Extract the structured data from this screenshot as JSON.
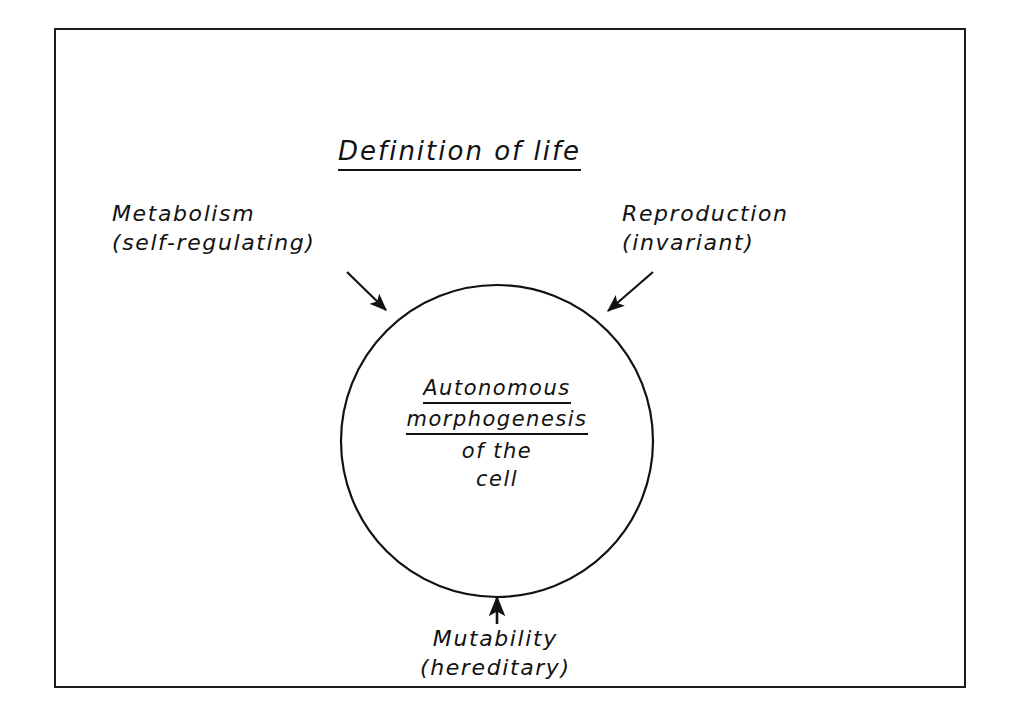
{
  "figure": {
    "title": "Definition of life",
    "frame": {
      "stroke_color": "#1c1c1c"
    },
    "ink_color": "#121212",
    "background": "#ffffff"
  },
  "circle": {
    "label_lines": [
      {
        "text": "Autonomous",
        "underlined": true
      },
      {
        "text": "morphogenesis",
        "underlined": true
      },
      {
        "text": "of  the",
        "underlined": false
      },
      {
        "text": "cell",
        "underlined": false
      }
    ],
    "center_x": 497,
    "center_y": 441,
    "radius": 156
  },
  "callouts": [
    {
      "key": "metabolism",
      "line1": "Metabolism",
      "line2": "(self-regulating)",
      "arrow_from": [
        347,
        272
      ],
      "arrow_to": [
        388,
        312
      ]
    },
    {
      "key": "reproduction",
      "line1": "Reproduction",
      "line2": "(invariant)",
      "arrow_from": [
        653,
        272
      ],
      "arrow_to": [
        606,
        313
      ]
    },
    {
      "key": "mutability",
      "line1": "Mutability",
      "line2": "(hereditary)",
      "arrow_from": [
        497,
        624
      ],
      "arrow_to": [
        497,
        594
      ]
    }
  ]
}
